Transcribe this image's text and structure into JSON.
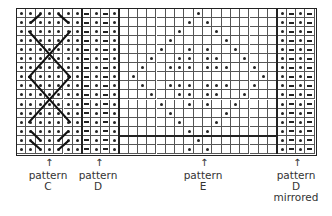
{
  "grid": {
    "rows": 16,
    "cell_w": 9.3,
    "cell_h": 9.05,
    "sections": [
      {
        "name": "pattern-c",
        "cols": 7,
        "fill": "dot-alt"
      },
      {
        "name": "pattern-d",
        "cols": 4,
        "fill": "dash-dot"
      },
      {
        "name": "pattern-e",
        "cols": 17,
        "fill": "diamond"
      },
      {
        "name": "pattern-d-mirrored",
        "cols": 4,
        "fill": "dot-dash"
      }
    ],
    "e_dots": [
      [
        8
      ],
      [
        7,
        9
      ],
      [
        6,
        10
      ],
      [
        5,
        11
      ],
      [
        4,
        7,
        9,
        12
      ],
      [
        3,
        6,
        7,
        9,
        10,
        13
      ],
      [
        2,
        5,
        6,
        7,
        9,
        10,
        11,
        14
      ],
      [
        1,
        15
      ],
      [
        2,
        5,
        6,
        7,
        9,
        10,
        11,
        14
      ],
      [
        3,
        6,
        7,
        9,
        10,
        13
      ],
      [
        4,
        7,
        9,
        12
      ],
      [
        5,
        11
      ],
      [
        6,
        10
      ],
      [
        7,
        9
      ],
      [
        8
      ],
      [
        7,
        9
      ]
    ],
    "colors": {
      "line": "#555555",
      "thick_line": "#222222",
      "mark": "#222222"
    }
  },
  "labels": [
    {
      "id": "c",
      "arrow": "↑",
      "lines": [
        "pattern",
        "C"
      ],
      "x": 48
    },
    {
      "id": "d",
      "arrow": "↑",
      "lines": [
        "pattern",
        "D"
      ],
      "x": 98
    },
    {
      "id": "e",
      "arrow": "↑",
      "lines": [
        "pattern",
        "E"
      ],
      "x": 203
    },
    {
      "id": "dm",
      "arrow": "↑",
      "lines": [
        "pattern",
        "D",
        "mirrored"
      ],
      "x": 296
    }
  ]
}
